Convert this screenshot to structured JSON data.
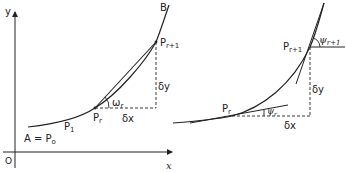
{
  "left_panel": {
    "axes": {
      "y_label": "y",
      "x_label": "x",
      "origin_label": "O"
    },
    "points": {
      "start": "A = P",
      "start_sub": "o",
      "p1": "P",
      "p1_sub": "1",
      "pr": "P",
      "pr_sub": "r",
      "pr1": "P",
      "pr1_sub": "r+1",
      "end": "B"
    },
    "angle_label": "ω",
    "angle_sub": "r",
    "dx_label": "δx",
    "dy_label": "δy"
  },
  "right_panel": {
    "points": {
      "pr": "P",
      "pr_sub": "r",
      "pr1": "P",
      "pr1_sub": "r+1"
    },
    "angle_r_label": "ψ",
    "angle_r_sub": "r",
    "angle_r1_label": "ψ",
    "angle_r1_sub": "r+1",
    "dx_label": "δx",
    "dy_label": "δy"
  },
  "colors": {
    "stroke": "#222222",
    "background": "#ffffff"
  }
}
